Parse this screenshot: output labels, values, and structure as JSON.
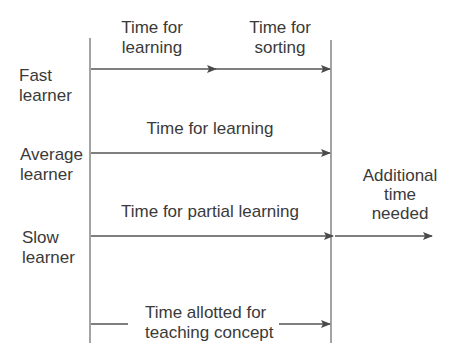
{
  "diagram": {
    "type": "timeline-comparison",
    "colors": {
      "line": "#555555",
      "text": "#3a3a3a",
      "background": "#ffffff"
    },
    "rows": [
      {
        "label_line1": "Fast",
        "label_line2": "learner",
        "segments": [
          {
            "label_line1": "Time for",
            "label_line2": "learning"
          },
          {
            "label_line1": "Time for",
            "label_line2": "sorting"
          }
        ]
      },
      {
        "label_line1": "Average",
        "label_line2": "learner",
        "segments": [
          {
            "label": "Time for learning"
          }
        ]
      },
      {
        "label_line1": "Slow",
        "label_line2": "learner",
        "segments": [
          {
            "label": "Time for partial learning"
          },
          {
            "label_line1": "Additional",
            "label_line2": "time",
            "label_line3": "needed"
          }
        ]
      }
    ],
    "allotted": {
      "label_line1": "Time allotted for",
      "label_line2": "teaching concept"
    }
  }
}
